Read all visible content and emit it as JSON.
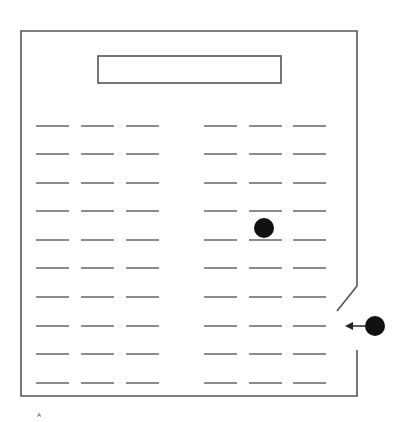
{
  "diagram": {
    "type": "classroom-seating-layout",
    "label": "A",
    "colors": {
      "line": "#555555",
      "dot": "#111111",
      "background": "#ffffff"
    },
    "room": {
      "left": 21,
      "top": 31,
      "right": 357,
      "bottom": 396,
      "door_gap": {
        "wall_break_top": 286,
        "door_end_x": 337,
        "door_end_y": 311,
        "wall_resume_y": 350
      }
    },
    "board": {
      "x": 98,
      "y": 56,
      "width": 183,
      "height": 27
    },
    "seat_columns_x": [
      [
        36,
        69
      ],
      [
        81,
        114
      ],
      [
        126,
        159
      ],
      [
        204,
        237
      ],
      [
        249,
        282
      ],
      [
        293,
        326
      ]
    ],
    "seat_rows_y": [
      126,
      154,
      183,
      211,
      240,
      268,
      297,
      326,
      354,
      383
    ],
    "markers": [
      {
        "name": "seated-person",
        "cx": 264,
        "cy": 228,
        "r": 10
      },
      {
        "name": "entering-person",
        "cx": 375,
        "cy": 326,
        "r": 10,
        "arrow_to_x": 345
      }
    ]
  }
}
